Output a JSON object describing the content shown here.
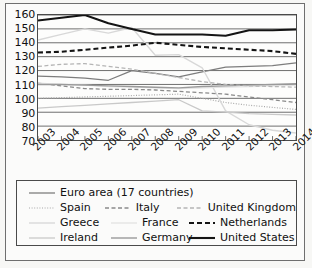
{
  "chart_data": {
    "type": "line",
    "title": "",
    "subtitle": "",
    "xlabel": "",
    "ylabel": "",
    "categories": [
      "2003",
      "2004",
      "2005",
      "2006",
      "2007",
      "2008",
      "2009",
      "2010",
      "2011",
      "2012",
      "2013",
      "2014"
    ],
    "x": [
      2003,
      2004,
      2005,
      2006,
      2007,
      2008,
      2009,
      2010,
      2011,
      2012,
      2013,
      2014
    ],
    "ylim": [
      70,
      160
    ],
    "yticks": [
      70,
      80,
      90,
      100,
      110,
      120,
      130,
      140,
      150,
      160
    ],
    "grid": true,
    "legend_position": "below-plot",
    "series": [
      {
        "name": "Euro area (17 countries)",
        "style": "solid",
        "color": "#7d7d7d",
        "width": 1.3,
        "values": [
          116,
          115.5,
          114.5,
          113,
          120,
          118,
          115.5,
          119,
          122.5,
          123,
          123.5,
          125.5
        ]
      },
      {
        "name": "Spain",
        "style": "dotted",
        "color": "#a8a8a8",
        "width": 1.2,
        "values": [
          100,
          100.5,
          101,
          101.5,
          102,
          102.5,
          103,
          100,
          97,
          95,
          93.5,
          92
        ]
      },
      {
        "name": "Greece",
        "style": "solid",
        "color": "#d8d8d8",
        "width": 1.4,
        "values": [
          142,
          146,
          150,
          147,
          151,
          131,
          131.5,
          122,
          91,
          81,
          77,
          75
        ]
      },
      {
        "name": "Ireland",
        "style": "solid",
        "color": "#c9c9c9",
        "width": 1.3,
        "values": [
          93,
          94,
          95,
          96,
          97,
          98,
          99,
          91,
          90,
          89,
          88.5,
          88
        ]
      },
      {
        "name": "Italy",
        "style": "dashed",
        "color": "#8a8a8a",
        "width": 1.3,
        "values": [
          111,
          109,
          107,
          106.5,
          106.5,
          106,
          105,
          104,
          103,
          101,
          99,
          97
        ]
      },
      {
        "name": "France",
        "style": "solid",
        "color": "#e2e2e2",
        "width": 1.3,
        "values": [
          111,
          110,
          109.5,
          108.5,
          108,
          107.5,
          107,
          107.5,
          108,
          108.5,
          109,
          109.5
        ]
      },
      {
        "name": "Germany",
        "style": "solid",
        "color": "#9a9a9a",
        "width": 1.4,
        "values": [
          110,
          110,
          109.5,
          109,
          108.5,
          108,
          107.5,
          108.5,
          109,
          109.5,
          110,
          110.5
        ]
      },
      {
        "name": "United Kingdom",
        "style": "dashed",
        "color": "#b5b5b5",
        "width": 1.3,
        "values": [
          123,
          124.5,
          125,
          123,
          121,
          118,
          115,
          112,
          110,
          109,
          108.5,
          108
        ]
      },
      {
        "name": "Netherlands",
        "style": "dashed",
        "color": "#141414",
        "width": 2.1,
        "values": [
          133,
          133.5,
          135,
          136.5,
          138,
          140,
          138.5,
          137,
          136,
          135,
          134,
          132
        ]
      },
      {
        "name": "United States",
        "style": "solid",
        "color": "#141414",
        "width": 2.1,
        "values": [
          156,
          158,
          160,
          154,
          150,
          146,
          146,
          146,
          145,
          149,
          149,
          149.5
        ]
      }
    ]
  },
  "legend": {
    "rows": [
      [
        {
          "series": 0
        }
      ],
      [
        {
          "series": 1
        },
        {
          "series": 4
        },
        {
          "series": 7
        }
      ],
      [
        {
          "series": 2
        },
        {
          "series": 5
        },
        {
          "series": 8
        }
      ],
      [
        {
          "series": 3
        },
        {
          "series": 6
        },
        {
          "series": 9
        }
      ]
    ]
  }
}
